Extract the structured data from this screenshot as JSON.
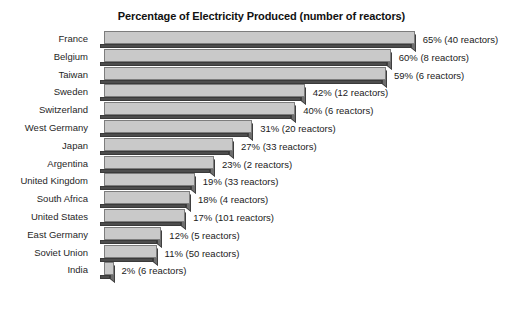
{
  "chart_data": {
    "type": "bar",
    "title": "Percentage of Electricity Produced (number of reactors)",
    "xlabel": "",
    "ylabel": "",
    "orientation": "horizontal",
    "grid": false,
    "legend": "none",
    "xlim": [
      0,
      65
    ],
    "categories": [
      "France",
      "Belgium",
      "Taiwan",
      "Sweden",
      "Switzerland",
      "West Germany",
      "Japan",
      "Argentina",
      "United Kingdom",
      "South Africa",
      "United States",
      "East Germany",
      "Soviet Union",
      "India"
    ],
    "values": [
      65,
      60,
      59,
      42,
      40,
      31,
      27,
      23,
      19,
      18,
      17,
      12,
      11,
      2
    ],
    "reactors": [
      40,
      8,
      6,
      12,
      6,
      20,
      33,
      2,
      33,
      4,
      101,
      5,
      50,
      6
    ],
    "data_labels": [
      "65% (40 reactors)",
      "60% (8 reactors)",
      "59% (6 reactors)",
      "42% (12 reactors)",
      "40% (6 reactors)",
      "31% (20 reactors)",
      "27% (33 reactors)",
      "23% (2 reactors)",
      "19% (33 reactors)",
      "18% (4 reactors)",
      "17% (101 reactors)",
      "12% (5 reactors)",
      "11% (50 reactors)",
      "2% (6 reactors)"
    ],
    "colors": {
      "bar_top": "#c9c9c9",
      "bar_front": "#4d4d4d",
      "bar_side": "#6e6e6e",
      "bar_outline": "#7d7d7d",
      "text": "#1a1a1a",
      "background": "#ffffff"
    }
  }
}
